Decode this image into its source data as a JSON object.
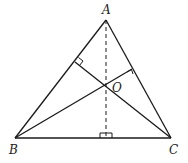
{
  "diagram": {
    "type": "triangle-orthocenter",
    "stroke_color": "#1a1a1a",
    "points": {
      "A": {
        "label": "A",
        "x": 106,
        "y": 20
      },
      "B": {
        "label": "B",
        "x": 15,
        "y": 138
      },
      "C": {
        "label": "C",
        "x": 171,
        "y": 138
      },
      "O": {
        "label": "O",
        "x": 106,
        "y": 85
      }
    },
    "segments": [
      "AB",
      "BC",
      "CA",
      "B-to-AC altitude",
      "C-to-AB altitude",
      "A-to-BC altitude (dashed)"
    ],
    "right_angle_marks": [
      "on AB",
      "on AC",
      "on BC"
    ]
  }
}
